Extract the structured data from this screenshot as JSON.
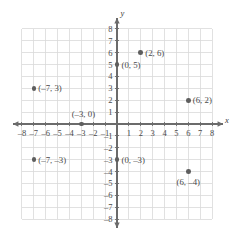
{
  "chart_data": {
    "type": "scatter",
    "title": "",
    "xlabel": "x",
    "ylabel": "y",
    "xlim": [
      -8,
      8
    ],
    "ylim": [
      -8,
      8
    ],
    "grid": true,
    "legend": "none",
    "xticks": [
      -8,
      -7,
      -6,
      -5,
      -4,
      -3,
      -2,
      -1,
      1,
      2,
      3,
      4,
      5,
      6,
      7,
      8
    ],
    "yticks": [
      8,
      7,
      6,
      5,
      4,
      3,
      2,
      1,
      -1,
      -2,
      -3,
      -4,
      -5,
      -6,
      -7,
      -8
    ],
    "xtick_labels": [
      "–8",
      "–7",
      "–6",
      "–5",
      "–4",
      "–3",
      "–2",
      "–1",
      "1",
      "2",
      "3",
      "4",
      "5",
      "6",
      "7",
      "8"
    ],
    "ytick_labels": [
      "8",
      "7",
      "6",
      "5",
      "4",
      "3",
      "2",
      "1",
      "–1",
      "–2",
      "–3",
      "–4",
      "–5",
      "–6",
      "–7",
      "–8"
    ],
    "points": [
      {
        "x": 2,
        "y": 6,
        "label": "(2, 6)",
        "label_pos": "right"
      },
      {
        "x": 0,
        "y": 5,
        "label": "(0, 5)",
        "label_pos": "right"
      },
      {
        "x": -7,
        "y": 3,
        "label": "(–7, 3)",
        "label_pos": "right"
      },
      {
        "x": 6,
        "y": 2,
        "label": "(6, 2)",
        "label_pos": "right"
      },
      {
        "x": -3,
        "y": 0,
        "label": "(–3, 0)",
        "label_pos": "above-left"
      },
      {
        "x": -7,
        "y": -3,
        "label": "(–7, –3)",
        "label_pos": "right"
      },
      {
        "x": 0,
        "y": -3,
        "label": "(0, –3)",
        "label_pos": "right"
      },
      {
        "x": 6,
        "y": -4,
        "label": "(6, –4)",
        "label_pos": "below"
      }
    ]
  },
  "colors": {
    "dot": "#5e5e5e",
    "axis": "#6b6b6b",
    "grid": "#d9d9d9",
    "text": "#4a4a4a",
    "background": "#ffffff"
  },
  "axis_labels": {
    "x": "x",
    "y": "y"
  }
}
